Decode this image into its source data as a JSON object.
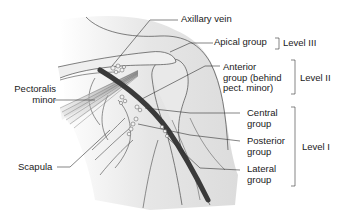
{
  "figure": {
    "type": "anatomical-diagram"
  },
  "labels": {
    "axillary_vein": "Axillary vein",
    "apical_group": "Apical group",
    "anterior_line1": "Anterior",
    "anterior_line2": "group (behind",
    "anterior_line3": "pect. minor)",
    "central_line1": "Central",
    "central_line2": "group",
    "posterior_line1": "Posterior",
    "posterior_line2": "group",
    "lateral_line1": "Lateral",
    "lateral_line2": "group",
    "pectoralis_line1": "Pectoralis",
    "pectoralis_line2": "minor",
    "scapula": "Scapula"
  },
  "levels": {
    "level3": "Level III",
    "level2": "Level II",
    "level1": "Level I"
  },
  "colors": {
    "vein": "#3a3a3a",
    "outline": "#4a4a4a",
    "shade": "#e4e4e4",
    "text": "#1a1a1a"
  }
}
